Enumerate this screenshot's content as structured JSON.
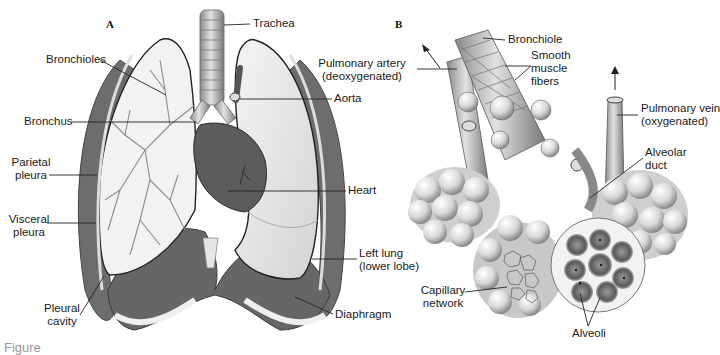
{
  "figure": {
    "colors": {
      "background": "#ffffff",
      "muscle": "#6d6d6d",
      "muscle_dark": "#555555",
      "lung_light": "#ececec",
      "heart": "#5c5c5c",
      "airway": "#cfcfcf",
      "label_text": "#1a1a1a",
      "leader_line": "#222222"
    },
    "panel_a": {
      "letter": "A",
      "labels": {
        "trachea": "Trachea",
        "bronchioles": "Bronchioles",
        "aorta": "Aorta",
        "bronchus": "Bronchus",
        "parietal_pleura_1": "Parietal",
        "parietal_pleura_2": "pleura",
        "heart": "Heart",
        "visceral_pleura_1": "Visceral",
        "visceral_pleura_2": "pleura",
        "left_lung_1": "Left lung",
        "left_lung_2": "(lower lobe)",
        "pleural_cavity_1": "Pleural",
        "pleural_cavity_2": "cavity",
        "diaphragm": "Diaphragm"
      }
    },
    "panel_b": {
      "letter": "B",
      "labels": {
        "bronchiole": "Bronchiole",
        "pulmonary_artery_1": "Pulmonary artery",
        "pulmonary_artery_2": "(deoxygenated)",
        "smooth_muscle_1": "Smooth",
        "smooth_muscle_2": "muscle",
        "smooth_muscle_3": "fibers",
        "pulmonary_vein_1": "Pulmonary vein",
        "pulmonary_vein_2": "(oxygenated)",
        "alveolar_duct_1": "Alveolar",
        "alveolar_duct_2": "duct",
        "capillary_network_1": "Capillary",
        "capillary_network_2": "network",
        "alveoli": "Alveoli"
      }
    },
    "caption_fragment": "Figure"
  }
}
